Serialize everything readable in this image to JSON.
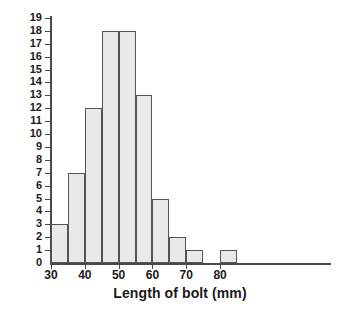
{
  "chart_data": {
    "type": "bar",
    "title": "",
    "xlabel": "Length of bolt (mm)",
    "ylabel": "",
    "bin_width": 5,
    "bin_edges": [
      30,
      35,
      40,
      45,
      50,
      55,
      60,
      65,
      70,
      75,
      80,
      85
    ],
    "categories": [
      "30-35",
      "35-40",
      "40-45",
      "45-50",
      "50-55",
      "55-60",
      "60-65",
      "65-70",
      "70-75",
      "75-80",
      "80-85"
    ],
    "values": [
      3,
      7,
      12,
      18,
      18,
      13,
      5,
      2,
      1,
      0,
      1
    ],
    "xlim": [
      25,
      100
    ],
    "ylim": [
      0,
      19
    ],
    "x_ticks": [
      30,
      40,
      50,
      60,
      70,
      80
    ],
    "x_tick_labels": [
      "30",
      "40",
      "50",
      "60",
      "70",
      "80"
    ],
    "y_ticks": [
      0,
      1,
      2,
      3,
      4,
      5,
      6,
      7,
      8,
      9,
      10,
      11,
      12,
      13,
      14,
      15,
      16,
      17,
      18,
      19
    ],
    "y_tick_labels": [
      "0",
      "1",
      "2",
      "3",
      "4",
      "5",
      "6",
      "7",
      "8",
      "9",
      "10",
      "11",
      "12",
      "13",
      "14",
      "15",
      "16",
      "17",
      "18",
      "19"
    ],
    "grid": false,
    "legend": null,
    "colors": {
      "bar_fill": "#e9e9e9",
      "bar_border": "#545454",
      "axis": "#4a4a4a",
      "text": "#1a1a1a",
      "background": "#ffffff"
    }
  }
}
